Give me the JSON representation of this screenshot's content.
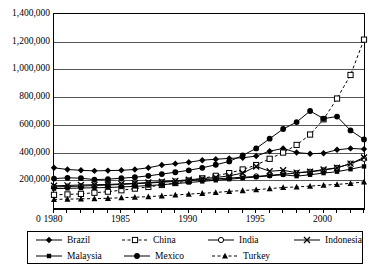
{
  "chart_data": {
    "type": "line",
    "title": "",
    "xlabel": "",
    "ylabel": "",
    "xlim": [
      1980,
      2003
    ],
    "ylim": [
      0,
      1400000
    ],
    "ytick_labels": [
      "1,400,000",
      "1,200,000",
      "1,000,000",
      "800,000",
      "600,000",
      "400,000",
      "200,000"
    ],
    "ytick_values": [
      1400000,
      1200000,
      1000000,
      800000,
      600000,
      400000,
      200000
    ],
    "xtick_labels": [
      "1980",
      "1985",
      "1990",
      "1995",
      "2000"
    ],
    "xtick_values": [
      1980,
      1985,
      1990,
      1995,
      2000
    ],
    "origin_label": "0",
    "grid": true,
    "legend_position": "bottom",
    "x": [
      1980,
      1981,
      1982,
      1983,
      1984,
      1985,
      1986,
      1987,
      1988,
      1989,
      1990,
      1991,
      1992,
      1993,
      1994,
      1995,
      1996,
      1997,
      1998,
      1999,
      2000,
      2001,
      2002,
      2003
    ],
    "series": [
      {
        "name": "Brazil",
        "marker": "filled-diamond",
        "dash": false,
        "values": [
          290000,
          278000,
          272000,
          268000,
          270000,
          272000,
          278000,
          290000,
          310000,
          320000,
          330000,
          345000,
          352000,
          358000,
          362000,
          375000,
          410000,
          430000,
          400000,
          392000,
          395000,
          420000,
          430000,
          425000
        ]
      },
      {
        "name": "China",
        "marker": "open-square",
        "dash": true,
        "values": [
          95000,
          98000,
          102000,
          110000,
          118000,
          128000,
          140000,
          152000,
          166000,
          180000,
          196000,
          214000,
          232000,
          252000,
          278000,
          310000,
          355000,
          400000,
          455000,
          530000,
          640000,
          790000,
          960000,
          1215000
        ]
      },
      {
        "name": "India",
        "marker": "open-circle",
        "dash": false,
        "values": [
          152000,
          155000,
          158000,
          162000,
          166000,
          170000,
          175000,
          180000,
          186000,
          192000,
          198000,
          204000,
          210000,
          216000,
          222000,
          228000,
          236000,
          244000,
          252000,
          262000,
          272000,
          290000,
          320000,
          355000
        ]
      },
      {
        "name": "Indonesia",
        "marker": "cross-x",
        "dash": false,
        "values": [
          160000,
          163000,
          166000,
          168000,
          170000,
          174000,
          178000,
          184000,
          190000,
          196000,
          204000,
          212000,
          220000,
          232000,
          252000,
          300000,
          265000,
          272000,
          255000,
          262000,
          278000,
          290000,
          320000,
          365000
        ]
      },
      {
        "name": "Malaysia",
        "marker": "small-filled-square",
        "dash": false,
        "values": [
          140000,
          142000,
          144000,
          146000,
          148000,
          152000,
          156000,
          162000,
          168000,
          176000,
          184000,
          192000,
          200000,
          208000,
          216000,
          224000,
          232000,
          240000,
          230000,
          240000,
          252000,
          262000,
          280000,
          300000
        ]
      },
      {
        "name": "Mexico",
        "marker": "filled-circle",
        "dash": false,
        "values": [
          212000,
          218000,
          215000,
          205000,
          208000,
          215000,
          222000,
          232000,
          245000,
          258000,
          272000,
          290000,
          312000,
          336000,
          380000,
          430000,
          500000,
          570000,
          620000,
          700000,
          645000,
          660000,
          560000,
          495000
        ]
      },
      {
        "name": "Turkey",
        "marker": "filled-triangle",
        "dash": true,
        "values": [
          62000,
          64000,
          66000,
          68000,
          70000,
          74000,
          78000,
          82000,
          88000,
          94000,
          100000,
          106000,
          112000,
          120000,
          126000,
          132000,
          140000,
          148000,
          152000,
          158000,
          165000,
          170000,
          178000,
          188000
        ]
      }
    ]
  },
  "legend": {
    "rows": [
      [
        {
          "label": "Brazil",
          "marker": "filled-diamond",
          "dash": false
        },
        {
          "label": "China",
          "marker": "open-square",
          "dash": true
        },
        {
          "label": "India",
          "marker": "open-circle",
          "dash": false
        },
        {
          "label": "Indonesia",
          "marker": "cross-x",
          "dash": false
        }
      ],
      [
        {
          "label": "Malaysia",
          "marker": "small-filled-square",
          "dash": false
        },
        {
          "label": "Mexico",
          "marker": "filled-circle",
          "dash": false
        },
        {
          "label": "Turkey",
          "marker": "filled-triangle",
          "dash": true
        }
      ]
    ]
  },
  "colors": {
    "line": "#000000",
    "grid": "#555555",
    "axis": "#000000",
    "background": "#ffffff"
  }
}
